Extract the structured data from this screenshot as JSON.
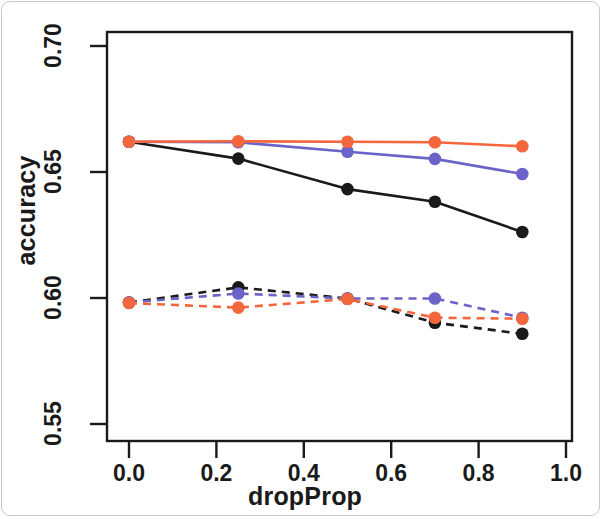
{
  "chart_data": {
    "type": "line",
    "title": "",
    "subtitle": "",
    "xlabel": "dropProp",
    "ylabel": "accuracy",
    "xlim": [
      0.0,
      1.0
    ],
    "ylim": [
      0.55,
      0.7
    ],
    "x": [
      0.0,
      0.25,
      0.5,
      0.7,
      0.9
    ],
    "xticks": [
      "0.0",
      "0.2",
      "0.4",
      "0.6",
      "0.8",
      "1.0"
    ],
    "xtick_values": [
      0.0,
      0.2,
      0.4,
      0.6,
      0.8,
      1.0
    ],
    "yticks": [
      "0.55",
      "0.60",
      "0.65",
      "0.70"
    ],
    "ytick_values": [
      0.55,
      0.6,
      0.65,
      0.7
    ],
    "grid": false,
    "legend": "none",
    "marker": "filled-circle",
    "series": [
      {
        "name": "black-solid",
        "color": "#1a1a1a",
        "linestyle": "solid",
        "values": [
          0.662,
          0.6553,
          0.6432,
          0.6382,
          0.6262
        ]
      },
      {
        "name": "blue-solid",
        "color": "#6b63c8",
        "linestyle": "solid",
        "values": [
          0.662,
          0.6618,
          0.658,
          0.6552,
          0.6492
        ]
      },
      {
        "name": "red-solid",
        "color": "#f4663c",
        "linestyle": "solid",
        "values": [
          0.662,
          0.6622,
          0.662,
          0.6618,
          0.6602
        ]
      },
      {
        "name": "black-dashed",
        "color": "#1a1a1a",
        "linestyle": "dashed",
        "values": [
          0.5982,
          0.6042,
          0.5998,
          0.5902,
          0.5858
        ]
      },
      {
        "name": "blue-dashed",
        "color": "#6b63c8",
        "linestyle": "dashed",
        "values": [
          0.5982,
          0.6018,
          0.5998,
          0.5998,
          0.5922
        ]
      },
      {
        "name": "red-dashed",
        "color": "#f4663c",
        "linestyle": "dashed",
        "values": [
          0.598,
          0.5962,
          0.5996,
          0.5922,
          0.5918
        ]
      }
    ]
  },
  "figure": {
    "background": "#ffffff",
    "frame_color": "#1a1a1a"
  }
}
